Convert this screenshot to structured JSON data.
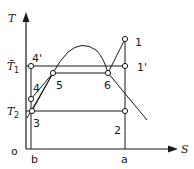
{
  "diagram": {
    "type": "T-S diagram",
    "axes": {
      "y_label": "T",
      "x_label": "S",
      "origin_label": "o"
    },
    "temperature_levels": {
      "t1_label": "T̄",
      "t1_subscript": "1",
      "t2_label": "T",
      "t2_subscript": "2"
    },
    "x_markers": [
      "b",
      "a"
    ],
    "points": [
      {
        "id": "1",
        "label": "1"
      },
      {
        "id": "1p",
        "label": "1'"
      },
      {
        "id": "2",
        "label": "2"
      },
      {
        "id": "3",
        "label": "3"
      },
      {
        "id": "4",
        "label": "4"
      },
      {
        "id": "4p",
        "label": "4'"
      },
      {
        "id": "5",
        "label": "5"
      },
      {
        "id": "6",
        "label": "6"
      }
    ],
    "colors": {
      "line": "#1a1a1a",
      "background": "#ffffff"
    }
  }
}
